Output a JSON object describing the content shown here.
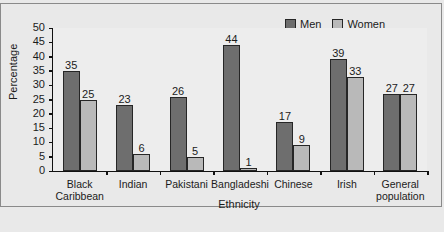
{
  "chart_data": {
    "type": "bar",
    "title": "",
    "xlabel": "Ethnicity",
    "ylabel": "Percentage",
    "ylim": [
      0,
      50
    ],
    "ytick_step": 5,
    "yticks": [
      "50",
      "45",
      "40",
      "35",
      "30",
      "25",
      "20",
      "15",
      "10",
      "5",
      "0"
    ],
    "grid": false,
    "legend_position": "top-right",
    "categories": [
      "Black Caribbean",
      "Indian",
      "Pakistani",
      "Bangladeshi",
      "Chinese",
      "Irish",
      "General population"
    ],
    "category_lines": [
      [
        "Black",
        "Caribbean"
      ],
      [
        "Indian"
      ],
      [
        "Pakistani"
      ],
      [
        "Bangladeshi"
      ],
      [
        "Chinese"
      ],
      [
        "Irish"
      ],
      [
        "General",
        "population"
      ]
    ],
    "series": [
      {
        "name": "Men",
        "color": "#6e6e6e",
        "values": [
          35,
          23,
          26,
          44,
          17,
          39,
          27
        ]
      },
      {
        "name": "Women",
        "color": "#b9b9b9",
        "values": [
          25,
          6,
          5,
          1,
          9,
          33,
          27
        ]
      }
    ]
  },
  "legend": {
    "items": [
      {
        "label": "Men",
        "swatch": "men"
      },
      {
        "label": "Women",
        "swatch": "women"
      }
    ]
  },
  "axes": {
    "y_title": "Percentage",
    "x_title": "Ethnicity"
  },
  "caption": ""
}
